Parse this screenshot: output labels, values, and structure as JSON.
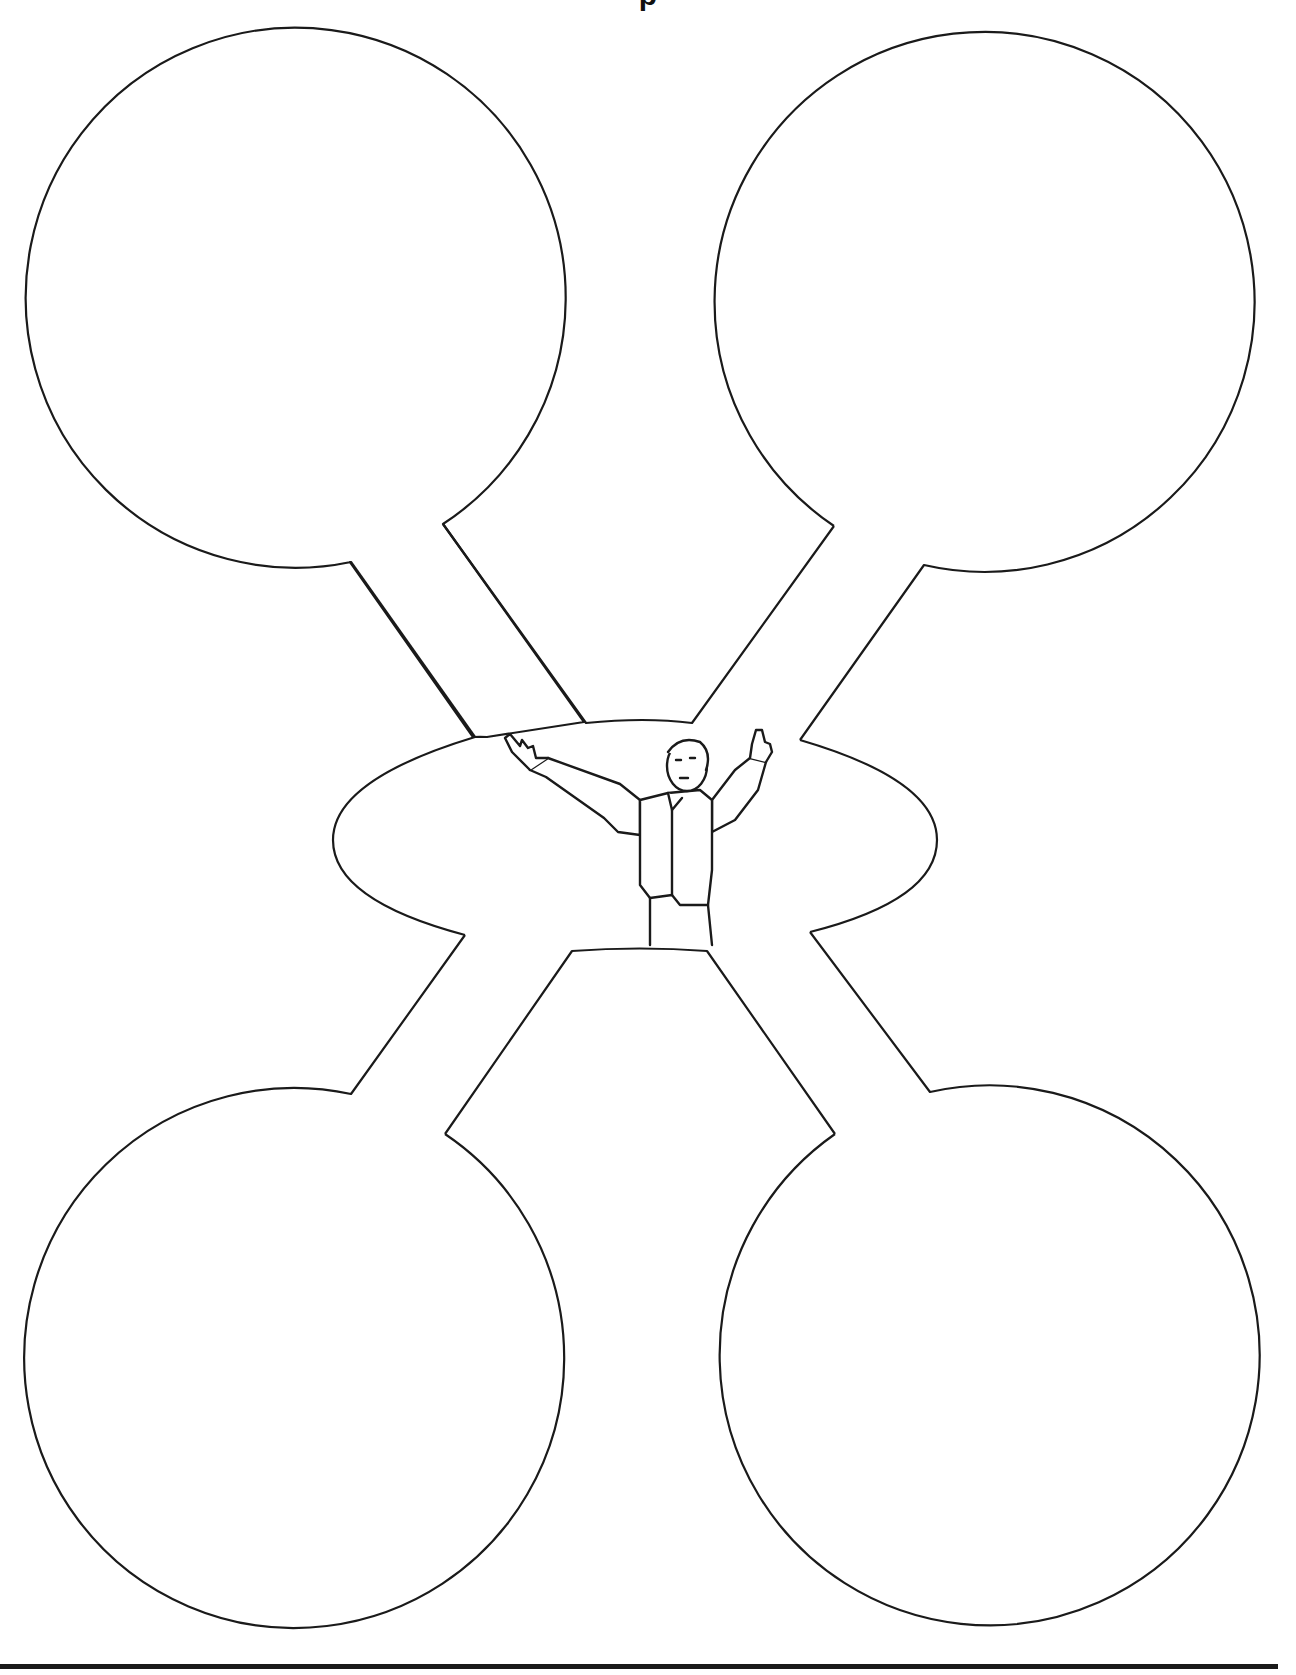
{
  "worksheet": {
    "title": "",
    "title_visible_fragment": "p",
    "bubbles": [
      {
        "id": "top-left",
        "label": ""
      },
      {
        "id": "top-right",
        "label": ""
      },
      {
        "id": "bottom-left",
        "label": ""
      },
      {
        "id": "bottom-right",
        "label": ""
      }
    ],
    "center": {
      "label": "",
      "illustration": "man-with-raised-arms"
    }
  },
  "colors": {
    "stroke": "#1a1a1a",
    "background": "#ffffff"
  }
}
